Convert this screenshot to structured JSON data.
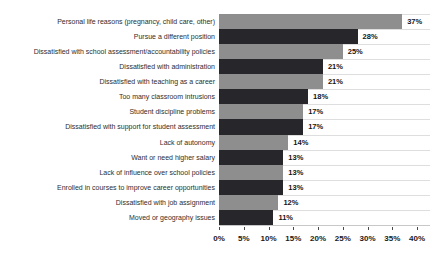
{
  "chart_data": {
    "type": "bar",
    "orientation": "horizontal",
    "categories": [
      "Personal life reasons (pregnancy, child care, other)",
      "Pursue a different position",
      "Dissatisfied with school assessment/accountability policies",
      "Dissatisfied with administration",
      "Dissatisfied with teaching as a career",
      "Too many classroom intrusions",
      "Student discipline problems",
      "Dissatisfied with support for student assessment",
      "Lack of autonomy",
      "Want or need higher salary",
      "Lack of influence over school policies",
      "Enrolled in courses to improve career opportunities",
      "Dissatisfied with job assignment",
      "Moved or geography issues"
    ],
    "values": [
      37,
      28,
      25,
      21,
      21,
      18,
      17,
      17,
      14,
      13,
      13,
      13,
      12,
      11
    ],
    "value_labels": [
      "37%",
      "28%",
      "25%",
      "21%",
      "21%",
      "18%",
      "17%",
      "17%",
      "14%",
      "13%",
      "13%",
      "13%",
      "12%",
      "11%"
    ],
    "x_ticks": [
      "0%",
      "5%",
      "10%",
      "15%",
      "20%",
      "25%",
      "30%",
      "35%",
      "40%"
    ],
    "x_tick_values": [
      0,
      5,
      10,
      15,
      20,
      25,
      30,
      35,
      40
    ],
    "xlim": [
      0,
      40
    ],
    "xlabel": "",
    "ylabel": "",
    "legend": "none",
    "grid": "horizontal row separator lines"
  },
  "colors": {
    "bar_alt_colors": [
      "#8e8e8e",
      "#26262b"
    ],
    "gridline": "#dedede",
    "axis_line": "#c8c8c8",
    "value_text": "#141414",
    "category_text": "#2e2e2e",
    "tick_text": "#1a1a1a",
    "background": "#ffffff"
  }
}
